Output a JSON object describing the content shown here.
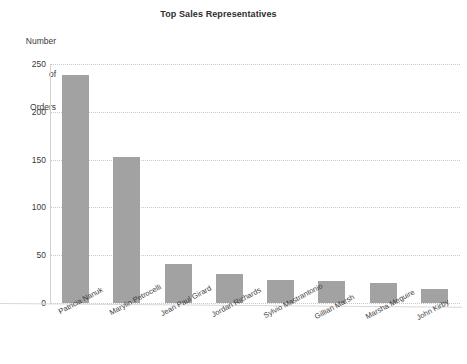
{
  "chart_data": {
    "type": "bar",
    "title": "Top Sales Representatives",
    "xlabel": "",
    "ylabel": "Number\nof\nOrders",
    "ylabel_lines": [
      "Number",
      "of",
      "Orders"
    ],
    "categories": [
      "Patricia Nanuk",
      "Marylin Petrocelli",
      "Jean Paul Girard",
      "Jordan Richards",
      "Sylvio Mastrantonio",
      "Gillian Marsh",
      "Marsha Meguire",
      "John Kirby"
    ],
    "values": [
      238,
      153,
      41,
      30,
      24,
      23,
      21,
      15
    ],
    "ylim": [
      0,
      250
    ],
    "yticks": [
      0,
      50,
      100,
      150,
      200,
      250
    ],
    "ytick_labels": [
      "0",
      "50",
      "100",
      "150",
      "200",
      "250"
    ],
    "grid": true,
    "legend": false,
    "bar_color": "#a2a2a2",
    "background_color": "#ffffff",
    "axis_color": "#d2d2d2",
    "gridline_color": "#c9c9c9",
    "text_color": "#3a3a3a"
  }
}
